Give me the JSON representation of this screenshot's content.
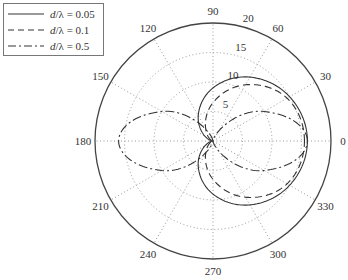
{
  "chart_data": {
    "type": "polar-line",
    "title": "",
    "angular_axis": {
      "unit": "degrees",
      "ticks": [
        0,
        30,
        60,
        90,
        120,
        150,
        180,
        210,
        240,
        270,
        300,
        330
      ],
      "tick_labels": [
        "0",
        "30",
        "60",
        "90",
        "120",
        "150",
        "180",
        "210",
        "240",
        "270",
        "300",
        "330"
      ],
      "direction": "counterclockwise",
      "zero_at": "east"
    },
    "radial_axis": {
      "range": [
        0,
        20
      ],
      "ticks": [
        5,
        10,
        15,
        20
      ],
      "tick_labels": [
        "5",
        "10",
        "15",
        "20"
      ],
      "label_angle_deg": 75
    },
    "grid": "dotted",
    "legend_position": "upper-left",
    "series": [
      {
        "name": "d/λ = 0.05",
        "style": "solid",
        "description": "cardioid-like lobe toward 0°, max ≈16 at 0°, ≈0 at 180°",
        "samples_theta_deg": [
          0,
          30,
          60,
          90,
          120,
          150,
          180,
          210,
          240,
          270,
          300,
          330
        ],
        "samples_r": [
          16,
          15,
          12.5,
          9,
          5,
          1.5,
          0,
          1.5,
          5,
          9,
          12.5,
          15
        ]
      },
      {
        "name": "d/λ = 0.1",
        "style": "dashed",
        "description": "cardioid-like lobe toward 0°, slightly narrower than 0.05, max ≈15.5 at 0°",
        "samples_theta_deg": [
          0,
          30,
          60,
          90,
          120,
          150,
          180,
          210,
          240,
          270,
          300,
          330
        ],
        "samples_r": [
          15.5,
          14.5,
          11,
          6.5,
          2.5,
          0.5,
          0,
          0.5,
          2.5,
          6.5,
          11,
          14.5
        ]
      },
      {
        "name": "d/λ = 0.5",
        "style": "dash-dot",
        "description": "bidirectional figure-eight lobes along 0° and 180°, max ≈16 on both sides",
        "samples_theta_deg": [
          0,
          30,
          60,
          90,
          120,
          150,
          180,
          210,
          240,
          270,
          300,
          330
        ],
        "samples_r": [
          16,
          10,
          2,
          0,
          2,
          10,
          16,
          10,
          2,
          0,
          2,
          10
        ]
      }
    ]
  },
  "legend": {
    "items": [
      {
        "prefix": "d",
        "suffix": "/λ = 0.05",
        "style": "solid"
      },
      {
        "prefix": "d",
        "suffix": "/λ = 0.1",
        "style": "dashed"
      },
      {
        "prefix": "d",
        "suffix": "/λ = 0.5",
        "style": "dash-dot"
      }
    ]
  },
  "colors": {
    "curve": "#333333",
    "grid": "#999999",
    "frame": "#444444",
    "text": "#333333"
  }
}
